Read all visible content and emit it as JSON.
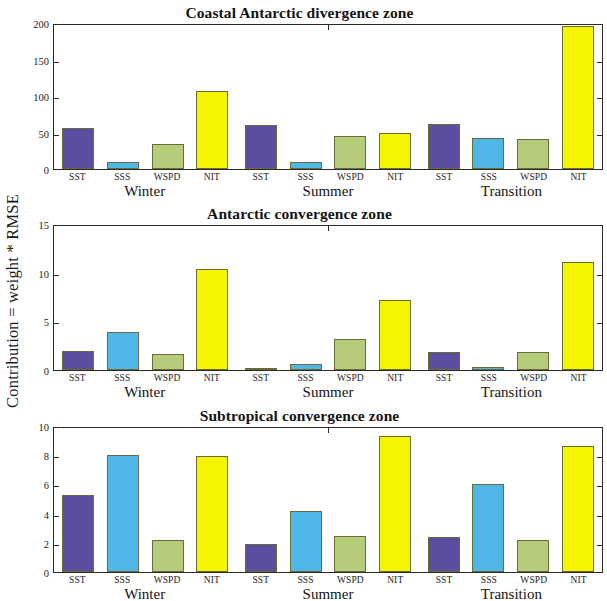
{
  "figure": {
    "ylabel": "Contribution = weight * RMSE",
    "colors": {
      "SST": "#5B4EA0",
      "SSS": "#4FB8E8",
      "WSPD": "#B5CC7A",
      "NIT": "#F5F500",
      "axis": "#2a2a2a",
      "text": "#141414"
    }
  },
  "chart_data": [
    {
      "type": "bar",
      "title": "Coastal Antarctic divergence zone",
      "xlabel": "",
      "ylabel": "Contribution = weight * RMSE",
      "ylim": [
        0,
        200
      ],
      "yticks": [
        0,
        50,
        100,
        150,
        200
      ],
      "grid": false,
      "legend": "none",
      "categories": [
        "Winter",
        "Summer",
        "Transition"
      ],
      "variables": [
        "SST",
        "SSS",
        "WSPD",
        "NIT"
      ],
      "series": [
        {
          "name": "SST",
          "values": [
            56,
            60,
            62
          ]
        },
        {
          "name": "SSS",
          "values": [
            10,
            9,
            42
          ]
        },
        {
          "name": "WSPD",
          "values": [
            34,
            45,
            41
          ]
        },
        {
          "name": "NIT",
          "values": [
            107,
            49,
            196
          ]
        }
      ]
    },
    {
      "type": "bar",
      "title": "Antarctic convergence zone",
      "xlabel": "",
      "ylabel": "Contribution = weight * RMSE",
      "ylim": [
        0,
        15
      ],
      "yticks": [
        0,
        5,
        10,
        15
      ],
      "grid": false,
      "legend": "none",
      "categories": [
        "Winter",
        "Summer",
        "Transition"
      ],
      "variables": [
        "SST",
        "SSS",
        "WSPD",
        "NIT"
      ],
      "series": [
        {
          "name": "SST",
          "values": [
            2.0,
            0.2,
            1.8
          ]
        },
        {
          "name": "SSS",
          "values": [
            3.9,
            0.6,
            0.35
          ]
        },
        {
          "name": "WSPD",
          "values": [
            1.6,
            3.2,
            1.85
          ]
        },
        {
          "name": "NIT",
          "values": [
            10.4,
            7.2,
            11.1
          ]
        }
      ]
    },
    {
      "type": "bar",
      "title": "Subtropical convergence zone",
      "xlabel": "",
      "ylabel": "Contribution = weight * RMSE",
      "ylim": [
        0,
        10
      ],
      "yticks": [
        0,
        2,
        4,
        6,
        8,
        10
      ],
      "grid": false,
      "legend": "none",
      "categories": [
        "Winter",
        "Summer",
        "Transition"
      ],
      "variables": [
        "SST",
        "SSS",
        "WSPD",
        "NIT"
      ],
      "series": [
        {
          "name": "SST",
          "values": [
            5.3,
            1.9,
            2.4
          ]
        },
        {
          "name": "SSS",
          "values": [
            8.0,
            4.2,
            6.0
          ]
        },
        {
          "name": "WSPD",
          "values": [
            2.2,
            2.5,
            2.2
          ]
        },
        {
          "name": "NIT",
          "values": [
            7.95,
            9.3,
            8.6
          ]
        }
      ]
    }
  ]
}
